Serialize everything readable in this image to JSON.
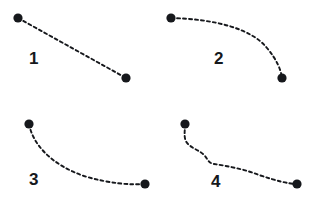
{
  "figure": {
    "title": "",
    "background_color": "#ffffff",
    "stroke_color": "#16181c",
    "dot_color": "#16181c",
    "dash_pattern": "3 3",
    "stroke_width": 1.9,
    "dot_radius": 4.6,
    "panel_count": 4
  },
  "panels": [
    {
      "id": "panel-1",
      "label": "1",
      "shape": "straight-line",
      "description": "straight dashed segment sloping down to the right",
      "start_point": {
        "x": 18,
        "y": 18
      },
      "end_point": {
        "x": 126,
        "y": 78
      },
      "path": "M 18 18 L 126 78"
    },
    {
      "id": "panel-2",
      "label": "2",
      "shape": "elbow-curve",
      "description": "dashed path running right then bending sharply downward",
      "start_point": {
        "x": 10,
        "y": 18
      },
      "end_point": {
        "x": 121,
        "y": 78
      },
      "path": "M 10 18 C 52 19, 90 28, 106 48 C 116 60, 120 70, 121 78"
    },
    {
      "id": "panel-3",
      "label": "3",
      "shape": "gentle-curve",
      "description": "dashed path curving down from upper left then flattening to the right",
      "start_point": {
        "x": 29,
        "y": 23
      },
      "end_point": {
        "x": 145,
        "y": 83
      },
      "path": "M 29 23 C 33 44, 52 64, 84 75 C 110 83, 132 84, 145 83"
    },
    {
      "id": "panel-4",
      "label": "4",
      "shape": "wavy-stepped",
      "description": "dashed path descending in a wavy stepped zig-zag",
      "start_point": {
        "x": 24,
        "y": 23
      },
      "end_point": {
        "x": 136,
        "y": 83
      },
      "path": "M 24 23 C 24 31, 22 38, 27 43 C 32 48, 38 49, 43 54 C 47 58, 47 62, 53 63 C 66 65, 83 68, 98 74 C 116 80, 128 83, 136 83"
    }
  ]
}
